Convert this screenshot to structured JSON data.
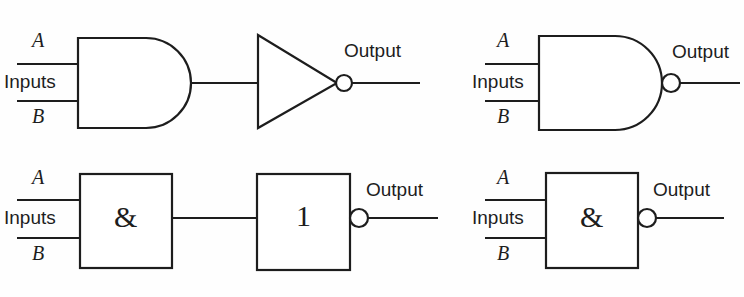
{
  "diagram": {
    "stroke_color": "#1d1d1d",
    "background_color": "#fefefe",
    "rows": [
      {
        "id": "row-traditional",
        "description": "Distinctive-shape symbols",
        "gates": [
          {
            "id": "and-gate-distinctive",
            "type": "AND",
            "shape": "distinctive",
            "inverted": false,
            "inner_symbol": "",
            "input_labels": [
              "A",
              "B"
            ],
            "inputs_label": "Inputs",
            "output_label": ""
          },
          {
            "id": "not-gate-distinctive",
            "type": "NOT",
            "shape": "triangle",
            "inverted": true,
            "inner_symbol": "",
            "input_labels": [],
            "inputs_label": "",
            "output_label": "Output"
          },
          {
            "id": "nand-gate-distinctive",
            "type": "NAND",
            "shape": "distinctive",
            "inverted": true,
            "inner_symbol": "",
            "input_labels": [
              "A",
              "B"
            ],
            "inputs_label": "Inputs",
            "output_label": "Output"
          }
        ]
      },
      {
        "id": "row-rectangular",
        "description": "Rectangular IEC symbols",
        "gates": [
          {
            "id": "and-gate-rectangular",
            "type": "AND",
            "shape": "rectangular",
            "inverted": false,
            "inner_symbol": "&",
            "input_labels": [
              "A",
              "B"
            ],
            "inputs_label": "Inputs",
            "output_label": ""
          },
          {
            "id": "not-gate-rectangular",
            "type": "NOT",
            "shape": "rectangular",
            "inverted": true,
            "inner_symbol": "1",
            "input_labels": [],
            "inputs_label": "",
            "output_label": "Output"
          },
          {
            "id": "nand-gate-rectangular",
            "type": "NAND",
            "shape": "rectangular",
            "inverted": true,
            "inner_symbol": "&",
            "input_labels": [
              "A",
              "B"
            ],
            "inputs_label": "Inputs",
            "output_label": "Output"
          }
        ]
      }
    ],
    "labels": {
      "tl_a": "A",
      "tl_b": "B",
      "tl_inputs": "Inputs",
      "tl_output": "Output",
      "tr_a": "A",
      "tr_b": "B",
      "tr_inputs": "Inputs",
      "tr_output": "Output",
      "bl_a": "A",
      "bl_b": "B",
      "bl_inputs": "Inputs",
      "bl_output": "Output",
      "br_a": "A",
      "br_b": "B",
      "br_inputs": "Inputs",
      "br_output": "Output",
      "and_symbol_left": "&",
      "not_symbol": "1",
      "and_symbol_right": "&"
    }
  }
}
